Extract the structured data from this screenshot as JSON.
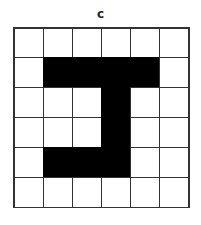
{
  "label": "c",
  "grid": {
    "rows": 6,
    "cols": 6,
    "colors": {
      "filled": "#000000",
      "empty": "#ffffff",
      "line": "#333333"
    },
    "cells": [
      [
        0,
        0,
        0,
        0,
        0,
        0
      ],
      [
        0,
        1,
        1,
        1,
        1,
        0
      ],
      [
        0,
        0,
        0,
        1,
        0,
        0
      ],
      [
        0,
        0,
        0,
        1,
        0,
        0
      ],
      [
        0,
        1,
        1,
        1,
        0,
        0
      ],
      [
        0,
        0,
        0,
        0,
        0,
        0
      ]
    ]
  }
}
